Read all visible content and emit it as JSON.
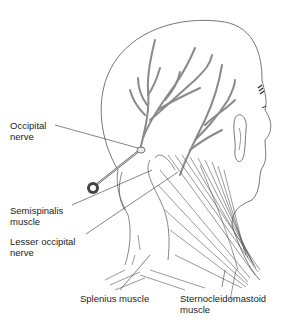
{
  "figure": {
    "labels": {
      "occipital_nerve": "Occipital\nnerve",
      "semispinalis_muscle": "Semispinalis\nmuscle",
      "lesser_occipital_nerve": "Lesser occipital\nnerve",
      "splenius_muscle": "Splenius muscle",
      "sternocleidomastoid_muscle": "Sternocleidomastoid\nmuscle"
    },
    "colors": {
      "outline": "#555555",
      "nerve": "#8a8a8a",
      "label_text": "#222222",
      "background": "#ffffff"
    }
  }
}
